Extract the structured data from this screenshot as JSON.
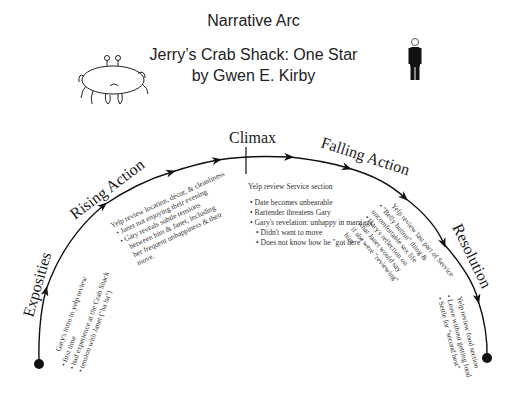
{
  "header": {
    "title": "Narrative Arc",
    "story_title": "Jerry’s Crab Shack: One Star",
    "author_line": "by Gwen E. Kirby"
  },
  "icons": {
    "left": "crab-drawing-icon",
    "right": "standing-man-figure-icon"
  },
  "arc": {
    "stages": [
      {
        "label": "Exposities"
      },
      {
        "label": "Rising Action"
      },
      {
        "label": "Climax"
      },
      {
        "label": "Falling Action"
      },
      {
        "label": "Resolution"
      }
    ]
  },
  "notes": {
    "exposition": {
      "header": "Gary's intro to yelp review",
      "bullets": [
        "first time",
        "bad experience at the Crab Shack",
        "tension with Janet (\"ha ha\")"
      ]
    },
    "rising": {
      "header": "Yelp review location, décor, & cleanliness",
      "bullets": [
        "Janet not enjoying their evening",
        "Gary reveals subtle tensions",
        "between him & Janet,  including",
        "her frequent unhappiness & their",
        "move."
      ]
    },
    "climax": {
      "header": "Yelp review Service section",
      "bullets": [
        "Date becomes unbearable",
        "Bartender threatens Gary",
        "Gary's revelation: unhappy in marriage."
      ],
      "sub_bullets": [
        "Didn't want to move",
        "Does not know how he \"got here\""
      ]
    },
    "falling": {
      "header": "Yelp review  last part of Service",
      "bullets": [
        "\"Belly button\" thing &",
        "uncomfortable sex life",
        "Gary's reflection on",
        "what Janet would say",
        "if she were \"reviewing\"",
        "him"
      ]
    },
    "resolution": {
      "header": "Yelp review food section",
      "bullets": [
        "Leave without getting food",
        "Settle for \"second best\""
      ]
    }
  }
}
